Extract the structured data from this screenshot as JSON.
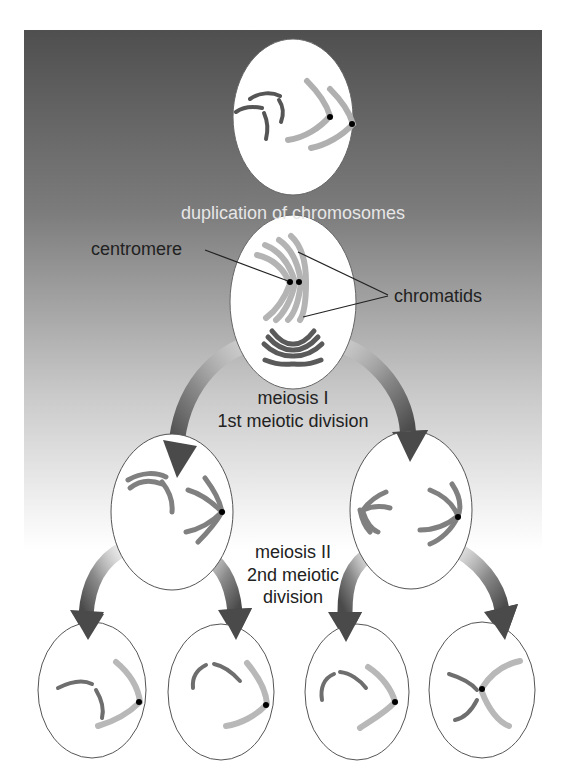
{
  "diagram": {
    "type": "meiosis-flow",
    "colors": {
      "background_top": "#4f4f4f",
      "background_bottom": "#ffffff",
      "cell_fill": "#ffffff",
      "cell_stroke": "#555555",
      "dark_chromosome": "#6e6e6e",
      "light_chromosome": "#b4b4b4",
      "centromere": "#000000",
      "arrow_dark": "#4a4a4a",
      "arrow_light": "#e8e8e8",
      "label_dark": "#222222",
      "label_light": "#e6e6e6"
    },
    "labels": {
      "duplication": "duplication of chromosomes",
      "centromere": "centromere",
      "chromatids": "chromatids",
      "meiosis1_line1": "meiosis I",
      "meiosis1_line2": "1st meiotic division",
      "meiosis2_line1": "meiosis II",
      "meiosis2_line2": "2nd meiotic",
      "meiosis2_line3": "division"
    },
    "stages": [
      {
        "id": "parent-cell",
        "cells": 1,
        "description": "cell with unduplicated chromosomes"
      },
      {
        "id": "duplicated-cell",
        "cells": 1,
        "description": "cell with duplicated chromosomes (sister chromatids joined at centromere)"
      },
      {
        "id": "meiosis-1-products",
        "cells": 2,
        "description": "two cells after 1st meiotic division"
      },
      {
        "id": "meiosis-2-products",
        "cells": 4,
        "description": "four cells after 2nd meiotic division"
      }
    ]
  }
}
